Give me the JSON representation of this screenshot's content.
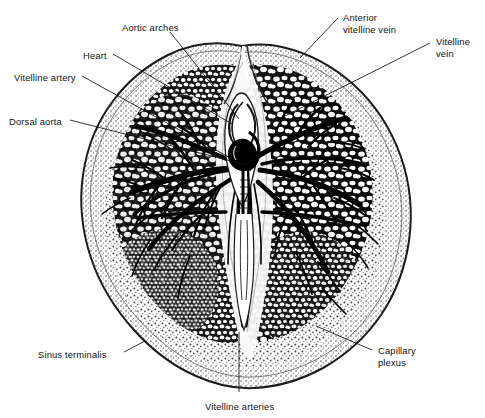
{
  "figure": {
    "type": "anatomical-line-drawing",
    "colors": {
      "ink": "#111111",
      "background": "#ffffff",
      "vessel": "#000000",
      "stipple": "#4a4a4a",
      "membrane": "#8a8a8a"
    },
    "canvas": {
      "width": 485,
      "height": 418
    }
  },
  "labels": [
    {
      "id": "aortic-arches",
      "line1": "Aortic arches",
      "line2": "",
      "x": 122,
      "y": 22,
      "anchor": "start"
    },
    {
      "id": "heart",
      "line1": "Heart",
      "line2": "",
      "x": 83,
      "y": 50,
      "anchor": "start"
    },
    {
      "id": "vitelline-artery",
      "line1": "Vitelline artery",
      "line2": "",
      "x": 14,
      "y": 72,
      "anchor": "start"
    },
    {
      "id": "dorsal-aorta",
      "line1": "Dorsal aorta",
      "line2": "",
      "x": 9,
      "y": 116,
      "anchor": "start"
    },
    {
      "id": "anterior-vitelline-vein",
      "line1": "Anterior",
      "line2": "vitelline vein",
      "x": 343,
      "y": 12,
      "anchor": "start"
    },
    {
      "id": "vitelline-vein",
      "line1": "Vitelline",
      "line2": "vein",
      "x": 436,
      "y": 36,
      "anchor": "start"
    },
    {
      "id": "capillary-plexus",
      "line1": "Capillary",
      "line2": "plexus",
      "x": 378,
      "y": 345,
      "anchor": "start"
    },
    {
      "id": "sinus-terminalis",
      "line1": "Sinus terminalis",
      "line2": "",
      "x": 38,
      "y": 349,
      "anchor": "start"
    },
    {
      "id": "vitelline-arteries",
      "line1": "Vitelline arteries",
      "line2": "",
      "x": 205,
      "y": 401,
      "anchor": "start"
    }
  ],
  "leaders": [
    {
      "id": "leader-aortic-arches",
      "points": "170,32 239,119"
    },
    {
      "id": "leader-heart",
      "points": "113,54 232,124"
    },
    {
      "id": "leader-vitelline-artery",
      "points": "82,76 234,160"
    },
    {
      "id": "leader-dorsal-aorta",
      "points": "70,120 247,165"
    },
    {
      "id": "leader-anterior-vitelline-vein",
      "points": "338,18 300,58"
    },
    {
      "id": "leader-vitelline-vein",
      "points": "430,43 277,120"
    },
    {
      "id": "leader-capillary-plexus",
      "points": "372,350 316,326"
    },
    {
      "id": "leader-sinus-terminalis",
      "points": "124,352 145,341"
    },
    {
      "id": "leader-vitelline-arteries",
      "points": "239,392 239,332"
    }
  ]
}
